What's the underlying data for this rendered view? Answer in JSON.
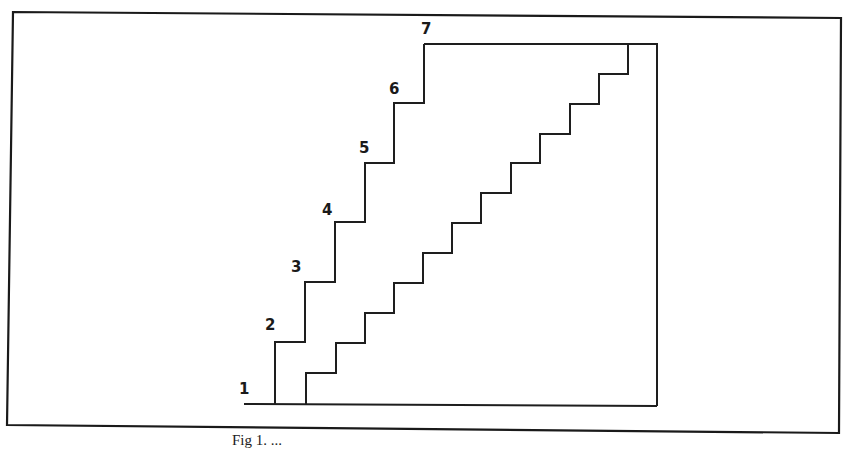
{
  "figure": {
    "step_labels": [
      "1",
      "2",
      "3",
      "4",
      "5",
      "6",
      "7"
    ],
    "caption": "Fig 1.   ...",
    "colors": {
      "stroke": "#1e1e1e",
      "background": "#ffffff"
    }
  },
  "outer_stair": {
    "description": "Tall stair with 6 risers, labelled steps 1-7",
    "points": [
      [
        244,
        404
      ],
      [
        275,
        404
      ],
      [
        275,
        342
      ],
      [
        305,
        342
      ],
      [
        305,
        282
      ],
      [
        335,
        282
      ],
      [
        335,
        222
      ],
      [
        365,
        222
      ],
      [
        365,
        163
      ],
      [
        394,
        163
      ],
      [
        394,
        103
      ],
      [
        424,
        103
      ],
      [
        424,
        44
      ],
      [
        657,
        44
      ],
      [
        657,
        406
      ],
      [
        306,
        404
      ]
    ]
  },
  "inner_stair": {
    "description": "Shallow stair with 12 risers",
    "start": [
      306,
      404
    ],
    "step_width": 29.3,
    "step_height": 30,
    "risers": 12
  }
}
